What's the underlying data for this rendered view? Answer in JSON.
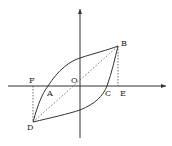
{
  "diagram": {
    "type": "hysteresis-loop",
    "colors": {
      "stroke": "#333333",
      "background": "#ffffff"
    },
    "points": {
      "O": {
        "label": "O",
        "x": 80,
        "y": 86
      },
      "A": {
        "label": "A",
        "x": 48,
        "y": 86
      },
      "B": {
        "label": "B",
        "x": 118,
        "y": 46
      },
      "C": {
        "label": "C",
        "x": 107,
        "y": 86
      },
      "D": {
        "label": "D",
        "x": 33,
        "y": 122
      },
      "E": {
        "label": "E",
        "x": 118,
        "y": 86
      },
      "F": {
        "label": "F",
        "x": 33,
        "y": 86
      }
    },
    "labels": {
      "O": "O",
      "A": "A",
      "B": "B",
      "C": "C",
      "D": "D",
      "E": "E",
      "F": "F"
    },
    "axes": {
      "horizontal_arrow": true,
      "vertical_arrow": true
    }
  }
}
